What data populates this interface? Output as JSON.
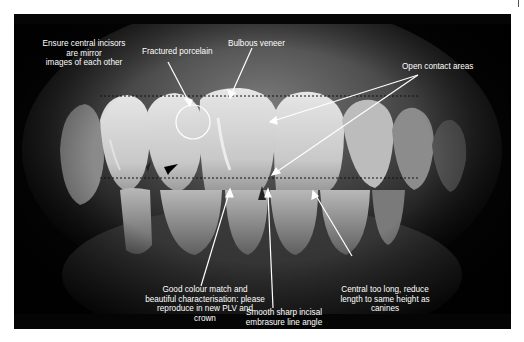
{
  "figure": {
    "annotations": {
      "mirror": {
        "lines": [
          "Ensure central incisors",
          "are mirror",
          "images of each other"
        ]
      },
      "fractured": {
        "text": "Fractured porcelain"
      },
      "bulbous": {
        "text": "Bulbous veneer"
      },
      "open_contact": {
        "text": "Open contact areas"
      },
      "colour_match": {
        "lines": [
          "Good colour match and",
          "beautiful characterisation: please",
          "reproduce in new PLV and",
          "crown"
        ]
      },
      "embrasure": {
        "lines": [
          "Smooth sharp incisal",
          "embrasure line angle"
        ]
      },
      "central_long": {
        "lines": [
          "Central too long, reduce",
          "length to same height as",
          "canines"
        ]
      }
    },
    "guide_lines": {
      "upper_y": 96,
      "lower_y": 178,
      "x_start": 100,
      "x_end": 420,
      "style": "dashed"
    },
    "colors": {
      "background": "#050505",
      "annotation": "#ffffff",
      "page": "#ffffff"
    }
  }
}
